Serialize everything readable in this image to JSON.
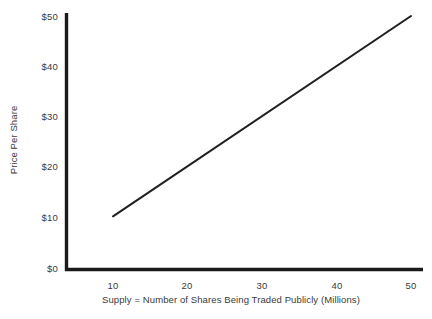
{
  "chart_data": {
    "type": "line",
    "title": "",
    "subtitle": "",
    "xlabel": "Supply = Number of Shares Being Traded Publicly (Millions)",
    "ylabel": "Price Per Share",
    "xlim": [
      5.5,
      53.5
    ],
    "ylim": [
      0,
      52
    ],
    "xticks": [
      10,
      20,
      30,
      40,
      50
    ],
    "xtick_labels": [
      "10",
      "20",
      "30",
      "40",
      "50"
    ],
    "yticks": [
      0,
      10,
      20,
      30,
      40,
      50
    ],
    "ytick_labels": [
      "$0",
      "$10",
      "$20",
      "$30",
      "$40",
      "$50"
    ],
    "grid": false,
    "legend": false,
    "series": [
      {
        "name": "Supply",
        "x": [
          10,
          50
        ],
        "values": [
          10.5,
          50.0
        ]
      }
    ],
    "line_color": "#231f20",
    "axis_color": "#1a1a1a",
    "background_color": "#ffffff",
    "text_color": "#3a3a3a"
  },
  "labels": {
    "ytick_0": "$0",
    "ytick_1": "$10",
    "ytick_2": "$20",
    "ytick_3": "$30",
    "ytick_4": "$40",
    "ytick_5": "$50",
    "xtick_0": "10",
    "xtick_1": "20",
    "xtick_2": "30",
    "xtick_3": "40",
    "xtick_4": "50",
    "x_axis_title": "Supply = Number of Shares Being Traded Publicly (Millions)",
    "y_axis_title": "Price Per Share"
  }
}
